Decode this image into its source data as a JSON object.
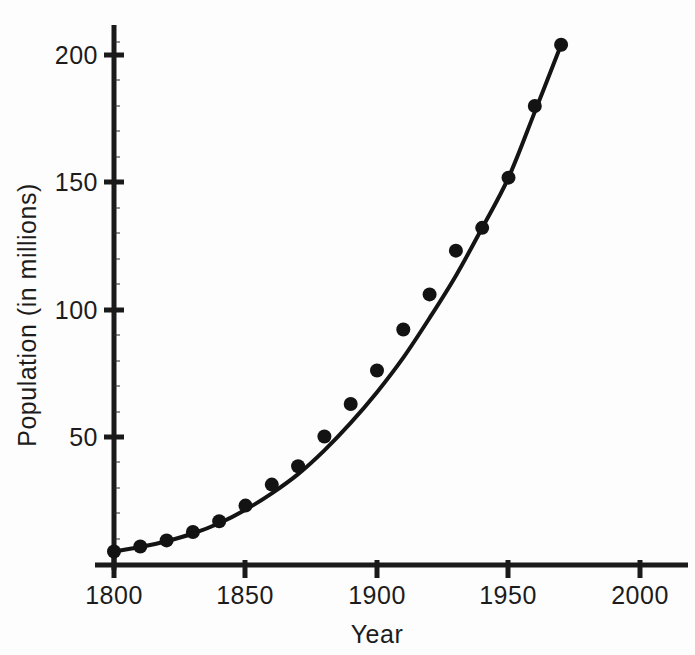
{
  "figure": {
    "caption_visible": false,
    "background_color": "#fdfdfd",
    "ink_color": "#141414"
  },
  "chart_data": {
    "type": "scatter",
    "title": "",
    "subtitle": "",
    "xlabel": "Year",
    "ylabel": "Population (in millions)",
    "xlim": [
      1790,
      2015
    ],
    "ylim": [
      0,
      212
    ],
    "grid": false,
    "legend": null,
    "x_ticks": [
      1800,
      1850,
      1900,
      1950,
      2000
    ],
    "x_tick_labels": [
      "1800",
      "1850",
      "1900",
      "1950",
      "2000"
    ],
    "y_ticks": [
      50,
      100,
      150,
      200
    ],
    "y_tick_labels": [
      "50",
      "100",
      "150",
      "200"
    ],
    "y_minor_tick_spacing": 10,
    "marker_style": "filled-circle",
    "marker_size_px": 9,
    "x": [
      1800,
      1810,
      1820,
      1830,
      1840,
      1850,
      1860,
      1870,
      1880,
      1890,
      1900,
      1910,
      1920,
      1930,
      1940,
      1950,
      1960,
      1970
    ],
    "y": [
      5.3,
      7.2,
      9.6,
      12.9,
      17.1,
      23.2,
      31.4,
      38.6,
      50.2,
      62.9,
      76.0,
      92.0,
      105.7,
      122.8,
      131.7,
      151.3,
      179.3,
      203.2
    ],
    "series": [
      {
        "name": "Census population",
        "kind": "points",
        "x": [
          1800,
          1810,
          1820,
          1830,
          1840,
          1850,
          1860,
          1870,
          1880,
          1890,
          1900,
          1910,
          1920,
          1930,
          1940,
          1950,
          1960,
          1970
        ],
        "values": [
          5.3,
          7.2,
          9.6,
          12.9,
          17.1,
          23.2,
          31.4,
          38.6,
          50.2,
          62.9,
          76.0,
          92.0,
          105.7,
          122.8,
          131.7,
          151.3,
          179.3,
          203.2
        ]
      },
      {
        "name": "Fitted exponential curve",
        "kind": "line",
        "x": [
          1800,
          1810,
          1820,
          1830,
          1840,
          1850,
          1860,
          1870,
          1880,
          1890,
          1900,
          1910,
          1920,
          1930,
          1940,
          1950,
          1960,
          1970
        ],
        "values": [
          5.3,
          7.0,
          9.3,
          12.3,
          16.3,
          21.6,
          28.0,
          35.5,
          44.8,
          55.5,
          67.5,
          81.0,
          96.5,
          113.0,
          131.7,
          151.3,
          177.0,
          203.2
        ]
      }
    ],
    "annotations": []
  },
  "axis_titles": {
    "x": "Year",
    "y": "Population (in millions)"
  }
}
